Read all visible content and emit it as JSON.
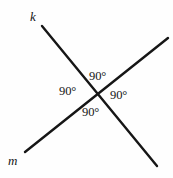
{
  "canvas": {
    "width": 173,
    "height": 178,
    "background_color": "#fefefe",
    "stroke_color": "#161616",
    "stroke_width": 2.4
  },
  "diagram": {
    "type": "intersecting-lines",
    "intersection": {
      "x": 97,
      "y": 96
    },
    "lines": [
      {
        "id": "k",
        "label": "k",
        "x1": 42,
        "y1": 26,
        "x2": 157,
        "y2": 166,
        "label_x": 30,
        "label_y": 10
      },
      {
        "id": "m",
        "label": "m",
        "x1": 25,
        "y1": 152,
        "x2": 168,
        "y2": 38,
        "label_x": 8,
        "label_y": 154
      }
    ],
    "angles": [
      {
        "id": "top",
        "label": "90°",
        "x": 89,
        "y": 70
      },
      {
        "id": "left",
        "label": "90°",
        "x": 59,
        "y": 85
      },
      {
        "id": "right",
        "label": "90°",
        "x": 110,
        "y": 89
      },
      {
        "id": "bottom",
        "label": "90°",
        "x": 82,
        "y": 106
      }
    ]
  }
}
